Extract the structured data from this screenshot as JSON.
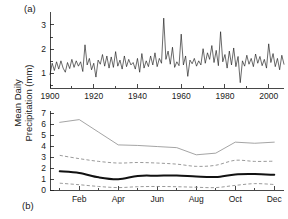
{
  "figure": {
    "y_axis_label": "Mean Daily\nPrecipitation (mm)",
    "panel_a_label": "(a)",
    "panel_b_label": "(b)"
  },
  "chart_data": [
    {
      "type": "line",
      "panel": "(a)",
      "title": "",
      "xlabel": "",
      "ylabel": "Mean Daily Precipitation (mm)",
      "xlim": [
        1900,
        2007
      ],
      "ylim": [
        0.4,
        3.45
      ],
      "grid": false,
      "legend": null,
      "xticks": [
        1900,
        1920,
        1940,
        1960,
        1980,
        2000
      ],
      "xtick_labels": [
        "1900",
        "1920",
        "1940",
        "1960",
        "1980",
        "2000"
      ],
      "xminor_ticks": [
        1910,
        1930,
        1950,
        1970,
        1990
      ],
      "yticks": [
        1,
        2,
        3
      ],
      "ytick_labels": [
        "1",
        "2",
        "3"
      ],
      "yminor_ticks": [
        0.5,
        1.5,
        2.5
      ],
      "series": [
        {
          "name": "Annual mean daily precipitation",
          "style": "thin-solid-black",
          "x": [
            1900,
            1901,
            1902,
            1903,
            1904,
            1905,
            1906,
            1907,
            1908,
            1909,
            1910,
            1911,
            1912,
            1913,
            1914,
            1915,
            1916,
            1917,
            1918,
            1919,
            1920,
            1921,
            1922,
            1923,
            1924,
            1925,
            1926,
            1927,
            1928,
            1929,
            1930,
            1931,
            1932,
            1933,
            1934,
            1935,
            1936,
            1937,
            1938,
            1939,
            1940,
            1941,
            1942,
            1943,
            1944,
            1945,
            1946,
            1947,
            1948,
            1949,
            1950,
            1951,
            1952,
            1953,
            1954,
            1955,
            1956,
            1957,
            1958,
            1959,
            1960,
            1961,
            1962,
            1963,
            1964,
            1965,
            1966,
            1967,
            1968,
            1969,
            1970,
            1971,
            1972,
            1973,
            1974,
            1975,
            1976,
            1977,
            1978,
            1979,
            1980,
            1981,
            1982,
            1983,
            1984,
            1985,
            1986,
            1987,
            1988,
            1989,
            1990,
            1991,
            1992,
            1993,
            1994,
            1995,
            1996,
            1997,
            1998,
            1999,
            2000,
            2001,
            2002,
            2003,
            2004,
            2005,
            2006,
            2007
          ],
          "values": [
            0.95,
            1.42,
            1.12,
            1.48,
            1.18,
            1.52,
            1.22,
            1.05,
            1.45,
            1.2,
            1.58,
            1.25,
            1.52,
            1.3,
            1.48,
            1.08,
            2.18,
            1.35,
            1.62,
            1.15,
            1.42,
            0.85,
            1.55,
            1.38,
            1.78,
            1.3,
            1.72,
            1.22,
            1.68,
            1.25,
            1.9,
            1.3,
            1.55,
            1.18,
            1.72,
            1.28,
            1.58,
            1.35,
            1.45,
            1.18,
            1.62,
            1.05,
            1.82,
            1.22,
            1.52,
            1.28,
            1.72,
            1.35,
            1.85,
            1.28,
            1.62,
            1.42,
            3.28,
            1.58,
            1.92,
            1.38,
            2.08,
            1.25,
            1.48,
            1.32,
            2.62,
            1.35,
            1.72,
            0.88,
            1.55,
            1.4,
            1.62,
            1.3,
            1.52,
            1.35,
            2.02,
            1.42,
            1.85,
            1.58,
            2.15,
            1.45,
            1.95,
            1.32,
            2.72,
            1.48,
            1.78,
            1.22,
            1.92,
            1.35,
            2.05,
            1.28,
            1.7,
            0.62,
            1.52,
            1.3,
            1.75,
            1.38,
            1.62,
            1.28,
            1.8,
            1.42,
            1.7,
            1.32,
            1.58,
            1.22,
            2.22,
            1.45,
            1.82,
            1.28,
            1.62,
            1.15,
            1.75,
            1.38
          ]
        }
      ]
    },
    {
      "type": "line",
      "panel": "(b)",
      "title": "",
      "xlabel": "",
      "ylabel": "Mean Daily Precipitation (mm)",
      "xlim": [
        0.5,
        12.5
      ],
      "ylim": [
        0,
        7
      ],
      "grid": false,
      "legend": null,
      "categories": [
        "Jan",
        "Feb",
        "Mar",
        "Apr",
        "May",
        "Jun",
        "Jul",
        "Aug",
        "Sep",
        "Oct",
        "Nov",
        "Dec"
      ],
      "xticks": [
        2,
        4,
        6,
        8,
        10,
        12
      ],
      "xtick_labels": [
        "Feb",
        "Apr",
        "Jun",
        "Aug",
        "Oct",
        "Dec"
      ],
      "xminor_ticks": [
        1,
        3,
        5,
        7,
        9,
        11
      ],
      "yticks": [
        0,
        1,
        2,
        3,
        4,
        5,
        6,
        7
      ],
      "ytick_labels": [
        "0",
        "1",
        "2",
        "3",
        "4",
        "5",
        "6",
        "7"
      ],
      "series": [
        {
          "name": "Maximum",
          "style": "thin-solid-gray",
          "values": [
            6.15,
            6.4,
            5.25,
            4.1,
            4.05,
            3.95,
            3.85,
            3.2,
            3.35,
            4.35,
            4.25,
            4.35
          ]
        },
        {
          "name": "Upper percentile",
          "style": "dashed-gray",
          "values": [
            3.15,
            2.85,
            2.6,
            2.45,
            2.5,
            2.45,
            2.35,
            2.15,
            2.25,
            2.7,
            2.6,
            2.62
          ]
        },
        {
          "name": "Mean",
          "style": "thick-solid-black",
          "values": [
            1.7,
            1.55,
            1.15,
            0.98,
            1.28,
            1.3,
            1.32,
            1.22,
            1.18,
            1.42,
            1.45,
            1.38
          ]
        },
        {
          "name": "Lower percentile",
          "style": "dashed-gray",
          "values": [
            0.62,
            0.48,
            0.32,
            0.22,
            0.3,
            0.32,
            0.3,
            0.25,
            0.22,
            0.42,
            0.58,
            0.5
          ]
        }
      ]
    }
  ]
}
